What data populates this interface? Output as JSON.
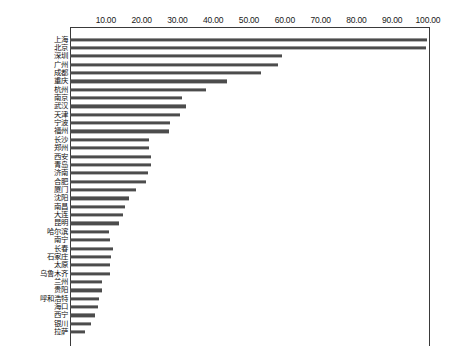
{
  "chart_data": {
    "type": "bar",
    "orientation": "horizontal",
    "title": "",
    "subtitle": "",
    "xlabel": "",
    "ylabel": "",
    "xlim": [
      0,
      100
    ],
    "ylim": null,
    "grid": false,
    "legend": null,
    "legend_position": "none",
    "bar_color": "#4c4c4c",
    "axis_color": "#3a3a3a",
    "x_ticks": [
      10,
      20,
      30,
      40,
      50,
      60,
      70,
      80,
      90,
      100
    ],
    "x_tick_labels": [
      "10.00",
      "20.00",
      "30.00",
      "40.00",
      "50.00",
      "60.00",
      "70.00",
      "80.00",
      "90.00",
      "100.00"
    ],
    "categories": [
      "上海",
      "北京",
      "深圳",
      "广州",
      "成都",
      "重庆",
      "杭州",
      "南京",
      "武汉",
      "天津",
      "宁波",
      "福州",
      "长沙",
      "郑州",
      "西安",
      "青岛",
      "济南",
      "合肥",
      "厦门",
      "沈阳",
      "南昌",
      "大连",
      "昆明",
      "哈尔滨",
      "南宁",
      "长春",
      "石家庄",
      "太原",
      "乌鲁木齐",
      "兰州",
      "贵阳",
      "呼和浩特",
      "海口",
      "西宁",
      "银川",
      "拉萨"
    ],
    "values": [
      99.7,
      99.4,
      59.2,
      58.1,
      53.4,
      43.9,
      38.0,
      31.3,
      32.4,
      30.7,
      27.9,
      27.6,
      22.1,
      22.1,
      22.6,
      22.6,
      21.8,
      21.2,
      18.4,
      16.5,
      15.4,
      14.8,
      13.7,
      10.9,
      11.2,
      12.0,
      11.5,
      11.2,
      11.2,
      8.9,
      8.9,
      8.1,
      7.8,
      7.0,
      5.9,
      4.2
    ],
    "value_format": "0.00"
  }
}
